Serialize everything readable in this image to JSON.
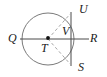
{
  "figure": {
    "type": "geometry-diagram",
    "width": 107,
    "height": 77,
    "background_color": "#ffffff",
    "stroke_color": "#6e6e6e",
    "line_color": "#4a4a4a",
    "dash_color": "#9a9a9a",
    "label_color": "#1a1a1a",
    "circle": {
      "center_x": 48,
      "center_y": 39,
      "radius": 26
    },
    "points": [
      {
        "id": "Q",
        "label": "Q",
        "x": 22,
        "y": 39,
        "label_x": 8,
        "label_y": 33
      },
      {
        "id": "T",
        "label": "T",
        "x": 48,
        "y": 39,
        "label_x": 41,
        "label_y": 42
      },
      {
        "id": "V",
        "label": "V",
        "x": 71,
        "y": 39,
        "label_x": 62,
        "label_y": 26
      },
      {
        "id": "U",
        "label": "U",
        "x": 71,
        "y": 14,
        "label_x": 79,
        "label_y": 4
      },
      {
        "id": "R",
        "label": "R",
        "x": 74,
        "y": 39,
        "label_x": 90,
        "label_y": 32
      },
      {
        "id": "S",
        "label": "S",
        "x": 71,
        "y": 64,
        "label_x": 78,
        "label_y": 61
      }
    ],
    "segments": [
      {
        "id": "QR",
        "name": "horizontal-diameter",
        "from": "Q",
        "to": "R",
        "style": "solid"
      },
      {
        "id": "US",
        "name": "vertical-chord",
        "from": "U",
        "to": "S",
        "style": "solid"
      },
      {
        "id": "TU",
        "name": "dashed-ray-to-U",
        "from": "T",
        "to": "U",
        "style": "dashed"
      },
      {
        "id": "TS",
        "name": "dashed-ray-to-S",
        "from": "T",
        "to": "S",
        "style": "dashed"
      }
    ],
    "center_dot": {
      "x": 48,
      "y": 38,
      "radius": 1.8
    }
  }
}
